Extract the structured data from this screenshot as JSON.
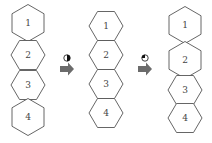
{
  "diagram": {
    "columns": [
      {
        "name": "initial",
        "cx": 28,
        "hexagons": [
          {
            "label": "1",
            "orientation": "pointy",
            "cy": 23
          },
          {
            "label": "2",
            "orientation": "flat",
            "cy": 55
          },
          {
            "label": "3",
            "orientation": "flat",
            "cy": 85
          },
          {
            "label": "4",
            "orientation": "pointy",
            "cy": 117
          }
        ]
      },
      {
        "name": "after-step-1",
        "cx": 106,
        "hexagons": [
          {
            "label": "1",
            "orientation": "flat",
            "cy": 26
          },
          {
            "label": "2",
            "orientation": "flat",
            "cy": 55
          },
          {
            "label": "3",
            "orientation": "flat",
            "cy": 84
          },
          {
            "label": "4",
            "orientation": "flat",
            "cy": 113
          }
        ]
      },
      {
        "name": "after-step-2",
        "cx": 185,
        "hexagons": [
          {
            "label": "1",
            "orientation": "pointy",
            "cy": 25
          },
          {
            "label": "2",
            "orientation": "pointy",
            "cy": 60
          },
          {
            "label": "3",
            "orientation": "flat",
            "cy": 90
          },
          {
            "label": "4",
            "orientation": "flat",
            "cy": 118
          }
        ]
      }
    ],
    "transitions": [
      {
        "icon": "half-circle-icon",
        "fill": "right-half",
        "x": 67,
        "y": 58
      },
      {
        "icon": "quarter-circle-icon",
        "fill": "top-left-quarter",
        "x": 145,
        "y": 58
      }
    ],
    "colors": {
      "stroke": "#555555",
      "arrow": "#6b6b6b",
      "icon": "#111111"
    }
  }
}
